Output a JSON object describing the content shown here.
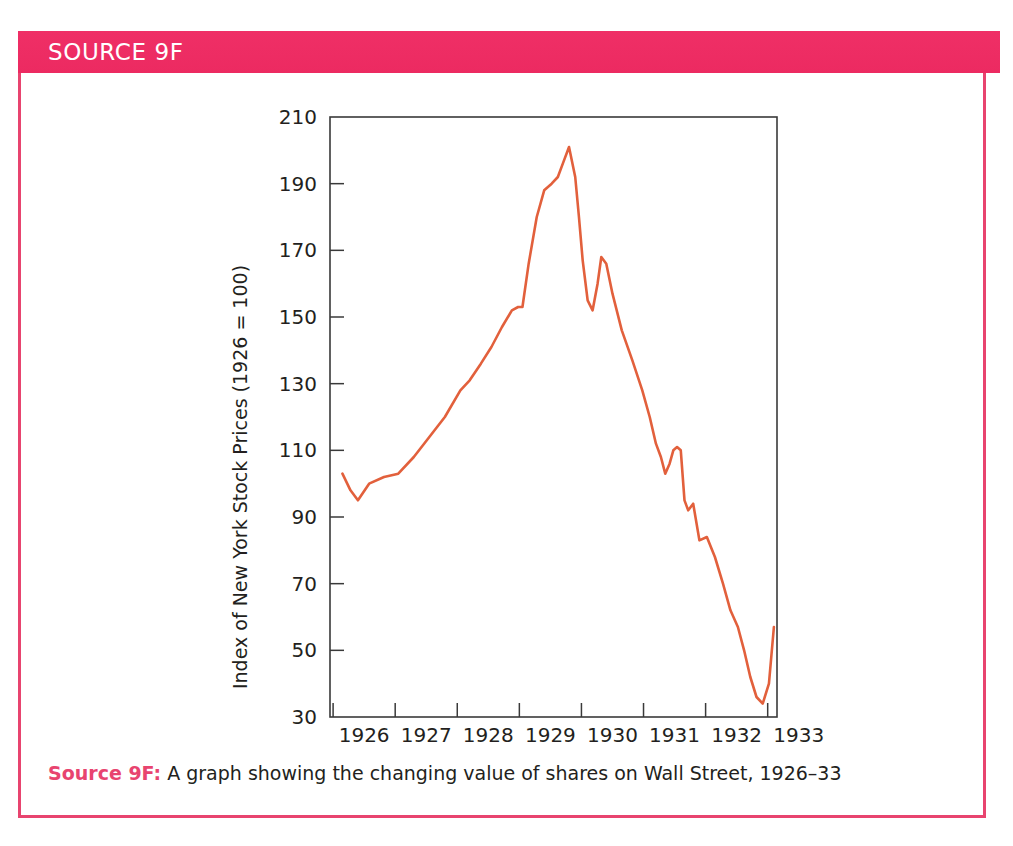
{
  "source_box": {
    "header_title": "SOURCE 9F",
    "accent_color": "#ee2c64",
    "border_color": "#e8446f"
  },
  "caption": {
    "label": "Source 9F:",
    "text": " A graph showing the changing value of shares on Wall Street, 1926–33"
  },
  "chart_data": {
    "type": "line",
    "title": "",
    "subtitle": "",
    "xlabel": "",
    "ylabel": "Index of New York Stock Prices (1926 = 100)",
    "xlim": [
      1925.85,
      1933.05
    ],
    "ylim": [
      30,
      210
    ],
    "yticks": [
      30,
      50,
      70,
      90,
      110,
      130,
      150,
      170,
      190,
      210
    ],
    "ytick_labels": [
      "30",
      "50",
      "70",
      "90",
      "110",
      "130",
      "150",
      "170",
      "190",
      "210"
    ],
    "xticks": [
      1926,
      1927,
      1928,
      1929,
      1930,
      1931,
      1932,
      1933
    ],
    "xtick_labels": [
      "1926",
      "1927",
      "1928",
      "1929",
      "1930",
      "1931",
      "1932",
      "1933"
    ],
    "grid": false,
    "legend": false,
    "line_color": "#e2603c",
    "series": [
      {
        "name": "Index of New York Stock Prices",
        "x": [
          1926.05,
          1926.18,
          1926.3,
          1926.48,
          1926.72,
          1926.95,
          1927.2,
          1927.45,
          1927.7,
          1927.95,
          1928.1,
          1928.28,
          1928.45,
          1928.62,
          1928.78,
          1928.88,
          1928.95,
          1929.05,
          1929.18,
          1929.3,
          1929.42,
          1929.52,
          1929.6,
          1929.7,
          1929.8,
          1929.86,
          1929.92,
          1930.0,
          1930.08,
          1930.16,
          1930.22,
          1930.3,
          1930.4,
          1930.55,
          1930.72,
          1930.88,
          1931.0,
          1931.1,
          1931.18,
          1931.25,
          1931.32,
          1931.38,
          1931.44,
          1931.5,
          1931.56,
          1931.62,
          1931.7,
          1931.8,
          1931.92,
          1932.05,
          1932.18,
          1932.3,
          1932.42,
          1932.52,
          1932.62,
          1932.72,
          1932.82,
          1932.92,
          1933.0
        ],
        "y": [
          103,
          98,
          95,
          100,
          102,
          103,
          108,
          114,
          120,
          128,
          131,
          136,
          141,
          147,
          152,
          153,
          153,
          166,
          180,
          188,
          190,
          192,
          196,
          201,
          192,
          180,
          167,
          155,
          152,
          160,
          168,
          166,
          157,
          146,
          137,
          128,
          120,
          112,
          108,
          103,
          106,
          110,
          111,
          110,
          95,
          92,
          94,
          83,
          84,
          78,
          70,
          62,
          57,
          50,
          42,
          36,
          34,
          40,
          57
        ]
      }
    ],
    "annotations": []
  }
}
